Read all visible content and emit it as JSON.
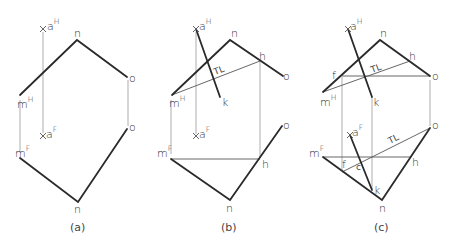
{
  "figure": {
    "panels": [
      {
        "id": "a",
        "caption": "(a)",
        "labels": {
          "aH_base": "a",
          "aH_sup": "H",
          "n_top": "n",
          "o_top": "o",
          "mH_base": "m",
          "mH_sup": "H",
          "aF_base": "a",
          "aF_sup": "F",
          "o_bottom": "o",
          "mF_base": "m",
          "mF_sup": "F",
          "n_bottom": "n"
        }
      },
      {
        "id": "b",
        "caption": "(b)",
        "labels": {
          "aH_base": "a",
          "aH_sup": "H",
          "n_top": "n",
          "h_top": "h",
          "o_top": "o",
          "TL": "TL",
          "mH_base": "m",
          "mH_sup": "H",
          "k": "k",
          "aF_base": "a",
          "aF_sup": "F",
          "o_bottom": "o",
          "mF_base": "m",
          "mF_sup": "F",
          "h_bottom": "h",
          "n_bottom": "n"
        }
      },
      {
        "id": "c",
        "caption": "(c)",
        "labels": {
          "aH_base": "a",
          "aH_sup": "H",
          "n_top": "n",
          "h_top": "h",
          "f_top": "f",
          "o_top": "o",
          "TL_top": "TL",
          "mH_base": "m",
          "mH_sup": "H",
          "k_top": "k",
          "aF_base": "a",
          "aF_sup": "F",
          "o_bottom": "o",
          "TL_bottom": "TL",
          "mF_base": "m",
          "mF_sup": "F",
          "f_bottom": "f",
          "h_bottom": "h",
          "k_bottom": "k",
          "n_bottom": "n",
          "mark": "c"
        }
      }
    ]
  }
}
